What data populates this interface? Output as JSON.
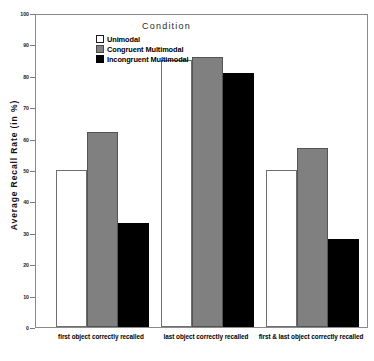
{
  "chart_data": {
    "type": "bar",
    "title": "",
    "xlabel": "",
    "ylabel": "Average Recall Rate (in %)",
    "ylim": [
      0,
      100
    ],
    "ytick_labels": [
      "0",
      "10",
      "20",
      "30",
      "40",
      "50",
      "60",
      "70",
      "80",
      "90",
      "100"
    ],
    "ytick_values": [
      0,
      10,
      20,
      30,
      40,
      50,
      60,
      70,
      80,
      90,
      100
    ],
    "grid": false,
    "legend_position": "top-left-inside",
    "legend_title": "Condition",
    "categories": [
      "first object correctly recalled",
      "last object correctly recalled",
      "first & last object correctly recalled"
    ],
    "series": [
      {
        "name": "Unimodal",
        "color": "#ffffff",
        "values": [
          50,
          85,
          50
        ]
      },
      {
        "name": "Congruent Multimodal",
        "color": "#808080",
        "values": [
          62,
          86,
          57
        ]
      },
      {
        "name": "Incongruent Multimodal",
        "color": "#000000",
        "values": [
          33,
          81,
          28
        ]
      }
    ]
  }
}
